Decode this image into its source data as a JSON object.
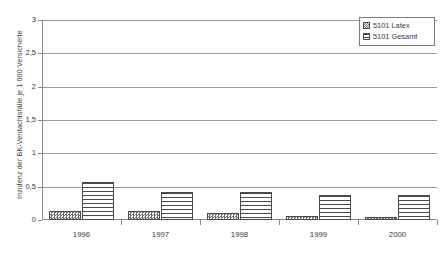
{
  "chart_data": {
    "type": "bar",
    "title": "",
    "subtitle": "",
    "xlabel": "",
    "ylabel": "Inzidenz der BK-Verdachtsfälle je 1 000 Versicherte",
    "categories": [
      "1996",
      "1997",
      "1998",
      "1999",
      "2000"
    ],
    "series": [
      {
        "name": "5101 Latex",
        "values": [
          0.14,
          0.13,
          0.11,
          0.06,
          0.05
        ]
      },
      {
        "name": "5101 Gesamt",
        "values": [
          0.57,
          0.42,
          0.42,
          0.38,
          0.38
        ]
      }
    ],
    "ylim": [
      0,
      3
    ],
    "ytick_values": [
      0,
      0.5,
      1,
      1.5,
      2,
      2.5,
      3
    ],
    "ytick_labels": [
      "0",
      "0,5",
      "1",
      "1,5",
      "2",
      "2,5",
      "3"
    ],
    "grid": "horizontal",
    "legend_position": "top-right",
    "legend_entries": [
      "5101 Latex",
      "5101 Gesamt"
    ]
  },
  "legend": {
    "items": [
      {
        "label": "5101 Latex",
        "marker": "checkered-swatch-icon"
      },
      {
        "label": "5101 Gesamt",
        "marker": "striped-swatch-icon"
      }
    ]
  },
  "axes": {
    "y_title": "Inzidenz der BK-Verdachtsfälle je 1 000 Versicherte",
    "y_labels": [
      "3",
      "2,5",
      "2",
      "1,5",
      "1",
      "0,5",
      "0"
    ],
    "x_labels": [
      "1996",
      "1997",
      "1998",
      "1999",
      "2000"
    ]
  },
  "colors": {
    "axis": "#8a8a8a",
    "gridline": "#9a9a9a",
    "bar_outline": "#4a4a4a",
    "text": "#3a3a3a",
    "background": "#ffffff"
  }
}
